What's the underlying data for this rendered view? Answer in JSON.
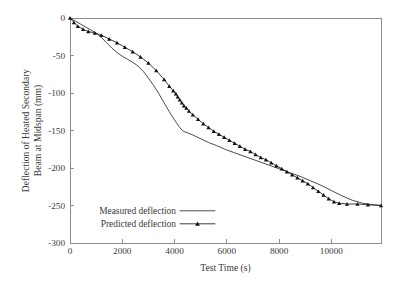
{
  "figure": {
    "title": "",
    "background_color": "#ffffff",
    "axis_color": "#8c8c8c",
    "text_color": "#3b3b3b",
    "series_color": "#1d1d1d"
  },
  "chart_data": {
    "type": "line",
    "title": "",
    "subtitle": "",
    "xlabel": "Test Time (s)",
    "ylabel": "Deflection of Heated Secondary Beam at Midspan (mm)",
    "ylabel_line1": "Deflection of Heated Secondary",
    "ylabel_line2": "Beam at Midspan (mm)",
    "xlim": [
      0,
      11900
    ],
    "ylim": [
      -300,
      0
    ],
    "xticks": [
      0,
      2000,
      4000,
      6000,
      8000,
      10000
    ],
    "xticklabels": [
      "0",
      "2000",
      "4000",
      "6000",
      "8000",
      "10000"
    ],
    "yticks": [
      0,
      -50,
      -100,
      -150,
      -200,
      -250,
      -300
    ],
    "yticklabels": [
      "0",
      "-50",
      "-100",
      "-150",
      "-200",
      "-250",
      "-300"
    ],
    "grid": false,
    "legend_position": "lower left",
    "legend": [
      {
        "name": "Measured deflection",
        "marker": "none",
        "line": "solid"
      },
      {
        "name": "Predicted deflection",
        "marker": "triangle",
        "line": "solid"
      }
    ],
    "series": [
      {
        "name": "Measured deflection",
        "marker": "none",
        "x": [
          0,
          200,
          400,
          600,
          800,
          1000,
          1200,
          1400,
          1600,
          1800,
          2000,
          2200,
          2400,
          2600,
          2800,
          3000,
          3200,
          3400,
          3600,
          3800,
          4000,
          4100,
          4200,
          4300,
          4400,
          4500,
          4700,
          5000,
          5300,
          5600,
          6000,
          6400,
          6800,
          7200,
          7600,
          8000,
          8400,
          8800,
          9200,
          9600,
          10000,
          10400,
          10800,
          11200,
          11600,
          11900
        ],
        "y": [
          0,
          -4,
          -8,
          -12,
          -16,
          -20,
          -26,
          -33,
          -40,
          -46,
          -51,
          -55,
          -59,
          -64,
          -71,
          -80,
          -90,
          -101,
          -113,
          -125,
          -136,
          -141,
          -146,
          -150,
          -152,
          -153,
          -156,
          -161,
          -166,
          -170,
          -176,
          -181,
          -186,
          -191,
          -196,
          -201,
          -206,
          -211,
          -217,
          -223,
          -230,
          -237,
          -243,
          -247,
          -249,
          -250
        ]
      },
      {
        "name": "Predicted deflection",
        "marker": "triangle",
        "x": [
          0,
          150,
          300,
          500,
          700,
          950,
          1200,
          1500,
          1800,
          2100,
          2400,
          2700,
          3000,
          3300,
          3600,
          3800,
          3950,
          4050,
          4120,
          4200,
          4280,
          4360,
          4450,
          4550,
          4700,
          4900,
          5100,
          5300,
          5500,
          5700,
          5900,
          6100,
          6300,
          6500,
          6700,
          6900,
          7100,
          7300,
          7500,
          7700,
          7900,
          8100,
          8300,
          8500,
          8700,
          8900,
          9100,
          9300,
          9500,
          9700,
          9900,
          10100,
          10300,
          10600,
          11000,
          11400,
          11900
        ],
        "y": [
          0,
          -6,
          -11,
          -15,
          -18,
          -20,
          -23,
          -28,
          -33,
          -39,
          -45,
          -52,
          -60,
          -70,
          -82,
          -91,
          -97,
          -101,
          -105,
          -109,
          -113,
          -117,
          -120,
          -124,
          -129,
          -135,
          -141,
          -146,
          -151,
          -155,
          -159,
          -163,
          -167,
          -171,
          -175,
          -178,
          -182,
          -186,
          -189,
          -193,
          -197,
          -201,
          -205,
          -209,
          -213,
          -217,
          -221,
          -226,
          -231,
          -236,
          -241,
          -245,
          -247,
          -248,
          -248,
          -249,
          -250
        ]
      }
    ],
    "marker_indices_predicted": [
      0,
      1,
      2,
      3,
      4,
      5,
      6,
      7,
      8,
      9,
      10,
      11,
      12,
      13,
      14,
      15,
      16,
      17,
      18,
      19,
      20,
      21,
      22,
      23,
      24,
      25,
      26,
      27,
      28,
      29,
      30,
      31,
      32,
      33,
      34,
      35,
      36,
      37,
      38,
      39,
      40,
      41,
      42,
      43,
      44,
      45,
      46,
      47,
      48,
      49,
      50,
      51,
      52,
      53,
      54,
      55,
      56
    ]
  },
  "plot_geometry": {
    "left": 70,
    "right": 381,
    "top": 18,
    "bottom": 243
  },
  "legend_layout": {
    "x_text_right": 176,
    "row1_y": 214,
    "row2_y": 227,
    "sample_x_start": 180,
    "sample_x_end": 215
  }
}
